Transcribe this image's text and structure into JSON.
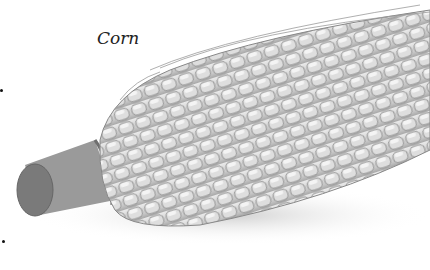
{
  "figure": {
    "label": "Corn",
    "colors": {
      "kernel": "#d6d6d6",
      "kernel_edge": "#8a8a8a",
      "stalk": "#8c8c8c",
      "background": "#ffffff"
    }
  }
}
